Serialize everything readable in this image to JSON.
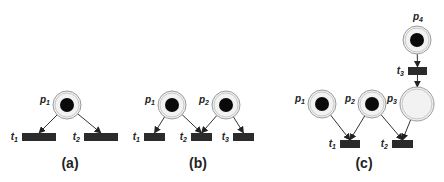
{
  "diagram": {
    "type": "petri-net",
    "panels": [
      {
        "caption": "(a)",
        "places": [
          {
            "id": "p1",
            "label": "p",
            "sub": "1",
            "cx": 67,
            "cy": 105,
            "r": 14,
            "tokens": 1
          }
        ],
        "transitions": [
          {
            "id": "t1",
            "label": "t",
            "sub": "1",
            "x": 22,
            "y": 133,
            "w": 34,
            "h": 8
          },
          {
            "id": "t2",
            "label": "t",
            "sub": "2",
            "x": 84,
            "y": 133,
            "w": 34,
            "h": 8
          }
        ],
        "arcs": [
          {
            "from": "p1",
            "to": "t1"
          },
          {
            "from": "p1",
            "to": "t2"
          }
        ]
      },
      {
        "caption": "(b)",
        "places": [
          {
            "id": "p1",
            "label": "p",
            "sub": "1",
            "cx": 172,
            "cy": 105,
            "r": 14,
            "tokens": 1
          },
          {
            "id": "p2",
            "label": "p",
            "sub": "2",
            "cx": 226,
            "cy": 105,
            "r": 14,
            "tokens": 1
          }
        ],
        "transitions": [
          {
            "id": "t1",
            "label": "t",
            "sub": "1",
            "x": 144,
            "y": 133,
            "w": 21,
            "h": 8
          },
          {
            "id": "t2",
            "label": "t",
            "sub": "2",
            "x": 191,
            "y": 133,
            "w": 21,
            "h": 8
          },
          {
            "id": "t3",
            "label": "t",
            "sub": "3",
            "x": 233,
            "y": 133,
            "w": 21,
            "h": 8
          }
        ],
        "arcs": [
          {
            "from": "p1",
            "to": "t1"
          },
          {
            "from": "p1",
            "to": "t2"
          },
          {
            "from": "p2",
            "to": "t2"
          },
          {
            "from": "p2",
            "to": "t3"
          }
        ]
      },
      {
        "caption": "(c)",
        "places": [
          {
            "id": "p1",
            "label": "p",
            "sub": "1",
            "cx": 322,
            "cy": 104,
            "r": 14,
            "tokens": 1
          },
          {
            "id": "p2",
            "label": "p",
            "sub": "2",
            "cx": 372,
            "cy": 104,
            "r": 14,
            "tokens": 1
          },
          {
            "id": "p3",
            "label": "p",
            "sub": "3",
            "cx": 417,
            "cy": 104,
            "r": 17,
            "tokens": 0
          },
          {
            "id": "p4",
            "label": "p",
            "sub": "4",
            "cx": 417,
            "cy": 40,
            "r": 14,
            "tokens": 1
          }
        ],
        "transitions": [
          {
            "id": "t1",
            "label": "t",
            "sub": "1",
            "x": 340,
            "y": 140,
            "w": 20,
            "h": 8
          },
          {
            "id": "t2",
            "label": "t",
            "sub": "2",
            "x": 392,
            "y": 140,
            "w": 21,
            "h": 8
          },
          {
            "id": "t3",
            "label": "t",
            "sub": "3",
            "x": 408,
            "y": 67,
            "w": 19,
            "h": 8
          }
        ],
        "arcs": [
          {
            "from": "p1",
            "to": "t1"
          },
          {
            "from": "p2",
            "to": "t1"
          },
          {
            "from": "p2",
            "to": "t2"
          },
          {
            "from": "p3",
            "to": "t2"
          },
          {
            "from": "p4",
            "to": "t3"
          },
          {
            "from": "t3",
            "to": "p3"
          }
        ]
      }
    ],
    "captions": [
      {
        "text": "(a)",
        "x": 70,
        "y": 168
      },
      {
        "text": "(b)",
        "x": 198,
        "y": 168
      },
      {
        "text": "(c)",
        "x": 364,
        "y": 168
      }
    ]
  }
}
